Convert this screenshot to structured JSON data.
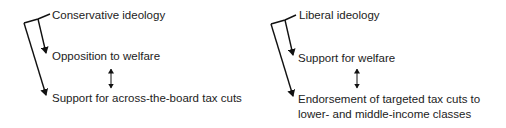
{
  "diagrams": [
    {
      "name": "conservative",
      "root": "Conservative ideology",
      "child1": "Opposition to welfare",
      "child2": "Support for across-the-board tax cuts",
      "relation": "bidirectional"
    },
    {
      "name": "liberal",
      "root": "Liberal ideology",
      "child1": "Support for welfare",
      "child2_line1": "Endorsement of targeted tax cuts to",
      "child2_line2": "lower- and middle-income classes",
      "relation": "bidirectional"
    }
  ],
  "colors": {
    "line": "#111111",
    "text": "#222222",
    "background": "#ffffff"
  }
}
